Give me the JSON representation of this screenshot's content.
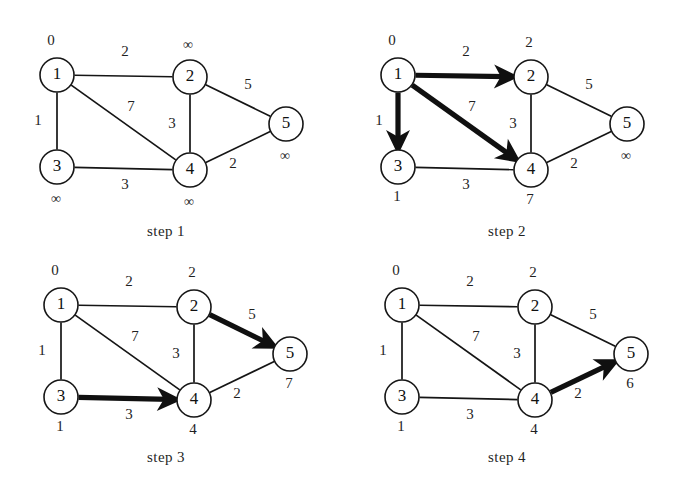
{
  "figure": {
    "width": 675,
    "height": 497,
    "background": "#ffffff",
    "ink": "#151515"
  },
  "graph": {
    "nodes": [
      {
        "id": "1",
        "label": "1",
        "x": 57,
        "y": 75,
        "r": 17
      },
      {
        "id": "2",
        "label": "2",
        "x": 190,
        "y": 77,
        "r": 17
      },
      {
        "id": "3",
        "label": "3",
        "x": 57,
        "y": 167,
        "r": 17
      },
      {
        "id": "4",
        "label": "4",
        "x": 190,
        "y": 170,
        "r": 17
      },
      {
        "id": "5",
        "label": "5",
        "x": 286,
        "y": 124,
        "r": 17
      }
    ],
    "edges": [
      {
        "from": "1",
        "to": "2",
        "weight": "2",
        "lx": 125,
        "ly": 53
      },
      {
        "from": "1",
        "to": "3",
        "weight": "1",
        "lx": 38,
        "ly": 122
      },
      {
        "from": "1",
        "to": "4",
        "weight": "7",
        "lx": 131,
        "ly": 108
      },
      {
        "from": "2",
        "to": "4",
        "weight": "3",
        "lx": 172,
        "ly": 125
      },
      {
        "from": "2",
        "to": "5",
        "weight": "5",
        "lx": 248,
        "ly": 86
      },
      {
        "from": "3",
        "to": "4",
        "weight": "3",
        "lx": 125,
        "ly": 186
      },
      {
        "from": "4",
        "to": "5",
        "weight": "2",
        "lx": 233,
        "ly": 165
      }
    ],
    "distance_offsets": {
      "1": {
        "dx": -6,
        "dy": -33
      },
      "2": {
        "dx": -2,
        "dy": -33
      },
      "3": {
        "dx": -1,
        "dy": 31
      },
      "4": {
        "dx": -1,
        "dy": 31
      },
      "5": {
        "dx": -1,
        "dy": 31
      }
    }
  },
  "panels": [
    {
      "key": "step1",
      "caption": "step 1",
      "origin": {
        "x": 0,
        "y": 0
      },
      "caption_at": {
        "x": 166,
        "y": 236
      },
      "distances": {
        "1": "0",
        "2": "∞",
        "3": "∞",
        "4": "∞",
        "5": "∞"
      },
      "highlighted_edges": []
    },
    {
      "key": "step2",
      "caption": "step 2",
      "origin": {
        "x": 341,
        "y": 0
      },
      "caption_at": {
        "x": 507,
        "y": 236
      },
      "distances": {
        "1": "0",
        "2": "2",
        "3": "1",
        "4": "7",
        "5": "∞"
      },
      "highlighted_edges": [
        {
          "from": "1",
          "to": "2"
        },
        {
          "from": "1",
          "to": "3"
        },
        {
          "from": "1",
          "to": "4"
        }
      ]
    },
    {
      "key": "step3",
      "caption": "step 3",
      "origin": {
        "x": 4,
        "y": 230
      },
      "caption_at": {
        "x": 166,
        "y": 462
      },
      "distances": {
        "1": "0",
        "2": "2",
        "3": "1",
        "4": "4",
        "5": "7"
      },
      "highlighted_edges": [
        {
          "from": "3",
          "to": "4"
        },
        {
          "from": "2",
          "to": "5"
        }
      ]
    },
    {
      "key": "step4",
      "caption": "step 4",
      "origin": {
        "x": 345,
        "y": 230
      },
      "caption_at": {
        "x": 507,
        "y": 462
      },
      "distances": {
        "1": "0",
        "2": "2",
        "3": "1",
        "4": "4",
        "5": "6"
      },
      "highlighted_edges": [
        {
          "from": "4",
          "to": "5"
        }
      ]
    }
  ]
}
